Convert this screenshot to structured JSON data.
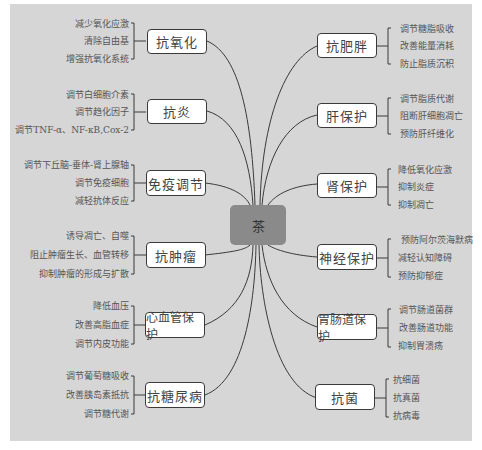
{
  "center": {
    "label": "茶"
  },
  "left_branches": [
    {
      "label": "抗氧化",
      "items": [
        "减少氧化应激",
        "清除自由基",
        "增强抗氧化系统"
      ]
    },
    {
      "label": "抗炎",
      "items": [
        "调节白细胞介素",
        "调节趋化因子",
        "调节TNF-α、NF-κB,Cox-2"
      ]
    },
    {
      "label": "免疫调节",
      "items": [
        "调节下丘脑-垂体-肾上腺轴",
        "调节免疫细胞",
        "减轻抗体反应"
      ]
    },
    {
      "label": "抗肿瘤",
      "items": [
        "诱导凋亡、自噬",
        "阻止肿瘤生长、血管转移",
        "抑制肿瘤的形成与扩散"
      ]
    },
    {
      "label": "心血管保护",
      "items": [
        "降低血压",
        "改善高脂血症",
        "调节内皮功能"
      ]
    },
    {
      "label": "抗糖尿病",
      "items": [
        "调节葡萄糖吸收",
        "改善胰岛素抵抗",
        "调节糖代谢"
      ]
    }
  ],
  "right_branches": [
    {
      "label": "抗肥胖",
      "items": [
        "调节糖脂吸收",
        "改善能量消耗",
        "防止脂质沉积"
      ]
    },
    {
      "label": "肝保护",
      "items": [
        "调节脂质代谢",
        "阻断肝细胞凋亡",
        "预防肝纤维化"
      ]
    },
    {
      "label": "肾保护",
      "items": [
        "降低氧化应激",
        "抑制炎症",
        "抑制凋亡"
      ]
    },
    {
      "label": "神经保护",
      "items": [
        "预防阿尔茨海默病",
        "减轻认知障碍",
        "预防抑郁症"
      ]
    },
    {
      "label": "胃肠道保护",
      "items": [
        "调节肠道菌群",
        "改善肠道功能",
        "抑制胃溃疡"
      ]
    },
    {
      "label": "抗菌",
      "items": [
        "抗细菌",
        "抗真菌",
        "抗病毒"
      ]
    }
  ],
  "colors": {
    "panel": "#d6d6d6",
    "center_fill": "#8a8a8a",
    "node_fill": "#ffffff",
    "line": "#3a3a3a"
  }
}
